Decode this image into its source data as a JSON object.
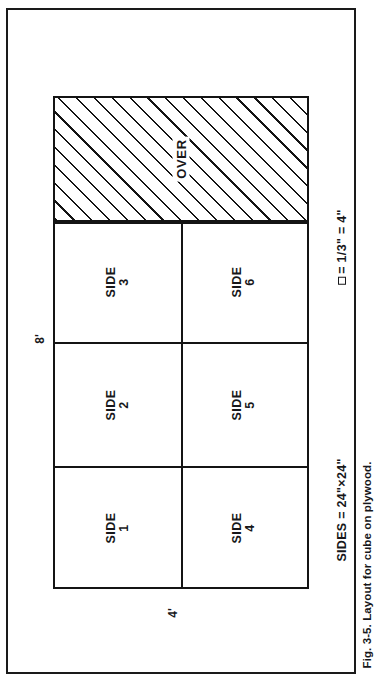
{
  "figure": {
    "caption": "Fig. 3-5. Layout for cube on plywood.",
    "sheet": {
      "height_label": "8'",
      "width_label": "4'"
    },
    "waste_region": {
      "label": "OVER",
      "fill": "diagonal-hatch"
    },
    "panels": [
      {
        "name": "SIDE",
        "number": "3",
        "position": "top-left"
      },
      {
        "name": "SIDE",
        "number": "6",
        "position": "top-right"
      },
      {
        "name": "SIDE",
        "number": "2",
        "position": "middle-left"
      },
      {
        "name": "SIDE",
        "number": "5",
        "position": "middle-right"
      },
      {
        "name": "SIDE",
        "number": "1",
        "position": "bottom-left"
      },
      {
        "name": "SIDE",
        "number": "4",
        "position": "bottom-right"
      }
    ],
    "notes": {
      "scale_symbol": "square-glyph",
      "scale": "= 1/3\" = 4\"",
      "sides": "SIDES = 24\"×24\""
    },
    "colors": {
      "ink": "#141414",
      "paper": "#ffffff"
    }
  }
}
